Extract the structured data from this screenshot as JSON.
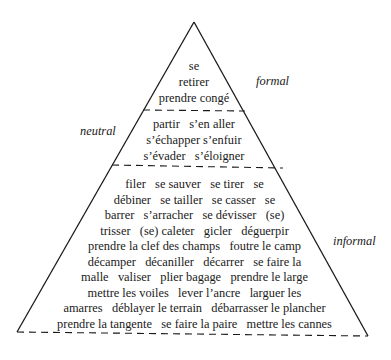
{
  "diagram": {
    "type": "register-pyramid",
    "labels": {
      "formal": "formal",
      "neutral": "neutral",
      "informal": "informal"
    },
    "sections": {
      "formal": {
        "lines": [
          "se",
          "retirer",
          "prendre congé"
        ]
      },
      "neutral": {
        "lines": [
          "partir   s’en aller",
          "s’échapper s’enfuir",
          "s’évader   s’éloigner"
        ]
      },
      "informal": {
        "lines": [
          "filer   se sauver   se tirer   se",
          "débiner   se tailler   se casser   se",
          "barrer   s’arracher   se dévisser   (se)",
          "trisser   (se) caleter   gicler   déguerpir",
          "prendre la clef des champs   foutre le camp",
          "décamper   décaniller   décarrer   se faire la",
          "malle   valiser   plier bagage   prendre le large",
          "mettre les voiles   lever l’ancre   larguer les",
          "amarres   déblayer le terrain   débarrasser le plancher",
          "prendre la tangente   se faire la paire   mettre les cannes",
          "jouer des quilles   agiter les crayons   tricoter des pincettes"
        ]
      }
    },
    "colors": {
      "line": "#1a1a1a",
      "background": "#ffffff"
    }
  }
}
